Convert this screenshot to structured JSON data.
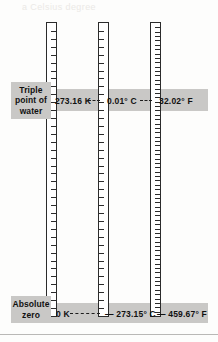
{
  "figure": {
    "ghost_text": "a Celsius degree"
  },
  "captions": {
    "triple_point": {
      "line1": "Triple",
      "line2": "point of",
      "line3": "water"
    },
    "absolute_zero": {
      "line1": "Absolute",
      "line2": "zero"
    }
  },
  "scales": [
    {
      "id": "kelvin",
      "name": "Kelvin",
      "unit": "K",
      "ticks": 37
    },
    {
      "id": "celsius",
      "name": "Celsius",
      "unit": "° C",
      "ticks": 37
    },
    {
      "id": "fahrenheit",
      "name": "Fahrenheit",
      "unit": "° F",
      "ticks": 67
    }
  ],
  "readings": {
    "triple_point": {
      "kelvin": "273.16 K",
      "celsius": "0.01° C",
      "fahrenheit": "32.02° F"
    },
    "absolute_zero": {
      "kelvin": "0 K",
      "celsius": "— 273.15° C",
      "fahrenheit": "— 459.67° F"
    }
  },
  "colors": {
    "band": "#c9c8c6",
    "tube_outline": "#2b2b2b",
    "tube_fill": "#ffffff",
    "text": "#111111",
    "page": "#fdfdfc"
  },
  "chart_data": {
    "type": "table",
    "columns": [
      "Reference point",
      "Kelvin",
      "Celsius",
      "Fahrenheit"
    ],
    "rows": [
      [
        "Triple point of water",
        "273.16 K",
        "0.01° C",
        "32.02° F"
      ],
      [
        "Absolute zero",
        "0 K",
        "— 273.15° C",
        "— 459.67° F"
      ]
    ],
    "series": [
      {
        "name": "Kelvin",
        "absolute_zero": 0,
        "triple_point": 273.16
      },
      {
        "name": "Celsius",
        "absolute_zero": -273.15,
        "triple_point": 0.01
      },
      {
        "name": "Fahrenheit",
        "absolute_zero": -459.67,
        "triple_point": 32.02
      }
    ],
    "legend_position": "none",
    "grid": false
  }
}
